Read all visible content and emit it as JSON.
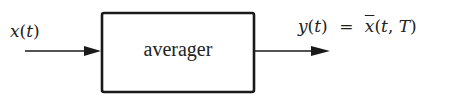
{
  "diagram": {
    "type": "block-diagram",
    "input": {
      "label": "x(t)",
      "var": "x",
      "arg": "(t)"
    },
    "block": {
      "label": "averager"
    },
    "output": {
      "label": "y(t) = x̄(t, T)",
      "lhs_var": "y",
      "lhs_arg": "(t)",
      "equals": "=",
      "rhs_var": "x",
      "rhs_arg": "(t, T)"
    },
    "colors": {
      "stroke": "#1a1a1a",
      "text": "#222222",
      "background": "#ffffff"
    }
  }
}
